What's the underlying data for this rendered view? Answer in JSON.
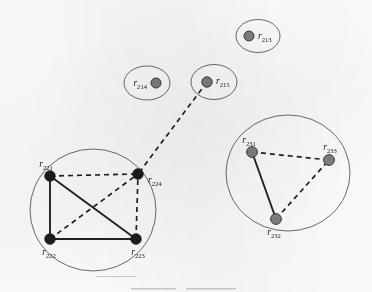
{
  "figure": {
    "title": "",
    "background_color": "#fdfdfd",
    "node_dark_color": "#1c1c1c",
    "node_gray_color": "#808080",
    "node_outline_color": "#3a3a3a",
    "edge_color": "#222222",
    "cluster_outline_color": "#6b6b6b"
  },
  "clusters": [
    {
      "id": "cluster-r213",
      "name": "cluster-r213",
      "cx": 258,
      "cy": 36,
      "rx": 22,
      "ry": 16.5,
      "nodes": [
        "r213"
      ]
    },
    {
      "id": "cluster-r214",
      "name": "cluster-r214",
      "cx": 147,
      "cy": 83,
      "rx": 23,
      "ry": 17,
      "nodes": [
        "r214"
      ]
    },
    {
      "id": "cluster-r215",
      "name": "cluster-r215",
      "cx": 214,
      "cy": 82,
      "rx": 23,
      "ry": 17.5,
      "nodes": [
        "r215"
      ]
    },
    {
      "id": "cluster-r22x",
      "name": "cluster-r22x",
      "cx": 93,
      "cy": 210,
      "rx": 63,
      "ry": 61,
      "nodes": [
        "r221",
        "r222",
        "r223",
        "r224"
      ]
    },
    {
      "id": "cluster-r23x",
      "name": "cluster-r23x",
      "cx": 288,
      "cy": 173,
      "rx": 62,
      "ry": 58,
      "nodes": [
        "r231",
        "r232",
        "r233"
      ]
    }
  ],
  "nodes": [
    {
      "id": "r213",
      "base": "r",
      "sub": "213",
      "x": 249,
      "y": 36,
      "r": 5.0,
      "fill": "gray",
      "label_x": 258,
      "label_y": 39,
      "label_anchor": "start"
    },
    {
      "id": "r214",
      "base": "r",
      "sub": "214",
      "x": 156,
      "y": 83,
      "r": 5.0,
      "fill": "gray",
      "label_x": 147,
      "label_y": 86,
      "label_anchor": "end"
    },
    {
      "id": "r215",
      "base": "r",
      "sub": "215",
      "x": 207,
      "y": 82,
      "r": 5.2,
      "fill": "gray",
      "label_x": 216,
      "label_y": 84,
      "label_anchor": "start"
    },
    {
      "id": "r221",
      "base": "r",
      "sub": "221",
      "x": 50,
      "y": 176,
      "r": 5.4,
      "fill": "dark",
      "label_x": 46,
      "label_y": 167,
      "label_anchor": "middle"
    },
    {
      "id": "r222",
      "base": "r",
      "sub": "222",
      "x": 50,
      "y": 239,
      "r": 5.4,
      "fill": "dark",
      "label_x": 49,
      "label_y": 255,
      "label_anchor": "middle"
    },
    {
      "id": "r223",
      "base": "r",
      "sub": "223",
      "x": 136,
      "y": 239,
      "r": 5.4,
      "fill": "dark",
      "label_x": 138,
      "label_y": 255,
      "label_anchor": "middle"
    },
    {
      "id": "r224",
      "base": "r",
      "sub": "224",
      "x": 138,
      "y": 174,
      "r": 5.4,
      "fill": "dark",
      "label_x": 148,
      "label_y": 183,
      "label_anchor": "start"
    },
    {
      "id": "r231",
      "base": "r",
      "sub": "231",
      "x": 252,
      "y": 152,
      "r": 5.4,
      "fill": "gray",
      "label_x": 249,
      "label_y": 143,
      "label_anchor": "middle"
    },
    {
      "id": "r232",
      "base": "r",
      "sub": "232",
      "x": 276,
      "y": 219,
      "r": 5.4,
      "fill": "gray",
      "label_x": 274,
      "label_y": 235,
      "label_anchor": "middle"
    },
    {
      "id": "r233",
      "base": "r",
      "sub": "233",
      "x": 329,
      "y": 160,
      "r": 5.4,
      "fill": "gray",
      "label_x": 330,
      "label_y": 150,
      "label_anchor": "middle"
    }
  ],
  "edges": [
    {
      "id": "e-r221-r224",
      "from": "r221",
      "to": "r224",
      "style": "dashed"
    },
    {
      "id": "e-r221-r222",
      "from": "r221",
      "to": "r222",
      "style": "solid"
    },
    {
      "id": "e-r221-r223",
      "from": "r221",
      "to": "r223",
      "style": "solid"
    },
    {
      "id": "e-r222-r223",
      "from": "r222",
      "to": "r223",
      "style": "solid"
    },
    {
      "id": "e-r222-r224",
      "from": "r222",
      "to": "r224",
      "style": "dashed"
    },
    {
      "id": "e-r223-r224",
      "from": "r223",
      "to": "r224",
      "style": "dashed"
    },
    {
      "id": "e-r215-r224",
      "from": "r215",
      "to": "r224",
      "style": "dashed"
    },
    {
      "id": "e-r231-r232",
      "from": "r231",
      "to": "r232",
      "style": "solid"
    },
    {
      "id": "e-r231-r233",
      "from": "r231",
      "to": "r233",
      "style": "dashed"
    },
    {
      "id": "e-r232-r233",
      "from": "r232",
      "to": "r233",
      "style": "dashed"
    }
  ],
  "artifacts": [
    {
      "id": "scan-mark-left",
      "x": 131,
      "y": 288,
      "width": 45,
      "height": 1.4
    },
    {
      "id": "scan-mark-right",
      "x": 186,
      "y": 288,
      "width": 50,
      "height": 1.4
    },
    {
      "id": "scan-streak",
      "x": 96,
      "y": 276,
      "width": 40,
      "height": 1.0
    }
  ]
}
